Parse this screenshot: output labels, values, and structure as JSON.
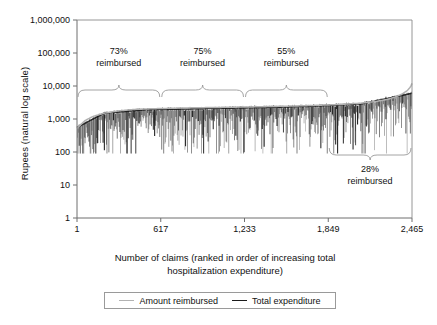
{
  "chart_data": {
    "type": "line",
    "title": "",
    "xlabel": "Number of claims (ranked in order of increasing total hospitalization expenditure)",
    "xlabel_line1": "Number of claims (ranked in order of increasing total",
    "xlabel_line2": "hospitalization expenditure)",
    "ylabel": "Rupees (natural log scale)",
    "y_scale": "log",
    "ylim": [
      1,
      1000000
    ],
    "xlim": [
      1,
      2465
    ],
    "grid": false,
    "legend_position": "bottom-center",
    "yticks": [
      {
        "value": 1000000,
        "label": "1,000,000"
      },
      {
        "value": 100000,
        "label": "100,000"
      },
      {
        "value": 10000,
        "label": "10,000"
      },
      {
        "value": 1000,
        "label": "1,000"
      },
      {
        "value": 100,
        "label": "100"
      },
      {
        "value": 10,
        "label": "10"
      },
      {
        "value": 1,
        "label": "1"
      }
    ],
    "xticks": [
      {
        "value": 1,
        "label": "1"
      },
      {
        "value": 617,
        "label": "617"
      },
      {
        "value": 1233,
        "label": "1,233"
      },
      {
        "value": 1849,
        "label": "1,849"
      },
      {
        "value": 2465,
        "label": "2,465"
      }
    ],
    "series": [
      {
        "name": "Amount reimbursed",
        "color": "#b2b2b2",
        "style": "smooth upper envelope",
        "x": [
          1,
          60,
          120,
          200,
          300,
          420,
          560,
          700,
          850,
          1000,
          1150,
          1300,
          1450,
          1600,
          1750,
          1900,
          2000,
          2100,
          2200,
          2280,
          2340,
          2390,
          2430,
          2455,
          2465
        ],
        "y": [
          520,
          900,
          1200,
          1500,
          1750,
          1950,
          2050,
          2120,
          2180,
          2230,
          2280,
          2330,
          2400,
          2480,
          2580,
          2720,
          2850,
          3050,
          3400,
          3900,
          4600,
          5600,
          7200,
          9500,
          12000
        ]
      },
      {
        "name": "Total expenditure",
        "color": "#1a1a1a",
        "style": "dense vertical spikes below envelope",
        "baseline_x": [
          1,
          200,
          500,
          900,
          1300,
          1700,
          2100,
          2465
        ],
        "baseline_y": [
          550,
          1500,
          1900,
          2050,
          2200,
          2400,
          2900,
          6000
        ],
        "spike_min_y": 90,
        "spike_typical_min_y": 300,
        "description": "Ranked claims; top edge tracks reimbursed envelope, downward spikes reach 100-1,000 rupees"
      }
    ],
    "annotations": [
      {
        "id": "brace-73",
        "pct": "73%",
        "label": "reimbursed",
        "x_start": 1,
        "x_end": 617,
        "direction": "down",
        "text_x": 309
      },
      {
        "id": "brace-75",
        "pct": "75%",
        "label": "reimbursed",
        "x_start": 617,
        "x_end": 1233,
        "direction": "down",
        "text_x": 925
      },
      {
        "id": "brace-55",
        "pct": "55%",
        "label": "reimbursed",
        "x_start": 1233,
        "x_end": 1849,
        "direction": "down",
        "text_x": 1541
      },
      {
        "id": "brace-28",
        "pct": "28%",
        "label": "reimbursed",
        "x_start": 1849,
        "x_end": 2465,
        "direction": "up",
        "text_x": 2157
      }
    ],
    "legend": [
      {
        "name": "Amount reimbursed",
        "color": "#b2b2b2"
      },
      {
        "name": "Total expenditure",
        "color": "#1a1a1a"
      }
    ]
  }
}
